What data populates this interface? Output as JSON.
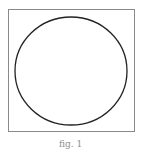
{
  "figure": {
    "caption": "fig. 1",
    "frame_color": "#8a8a8a",
    "circle": {
      "cx": 71,
      "cy": 71,
      "r": 55,
      "stroke": "#222222"
    }
  }
}
